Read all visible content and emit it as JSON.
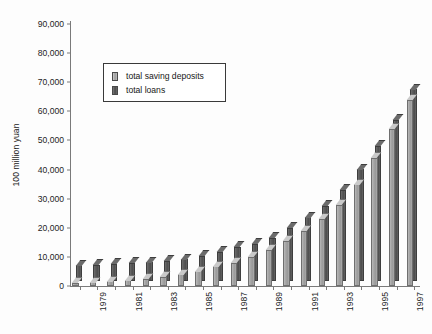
{
  "chart_data": {
    "type": "bar",
    "title": "",
    "subtitle": "",
    "xlabel": "",
    "ylabel": "100 million yuan",
    "ylim": [
      0,
      90000
    ],
    "ytick_labels": [
      "0",
      "10,000",
      "20,000",
      "30,000",
      "40,000",
      "50,000",
      "60,000",
      "70,000",
      "80,000",
      "90,000"
    ],
    "ytick_values": [
      0,
      10000,
      20000,
      30000,
      40000,
      50000,
      60000,
      70000,
      80000,
      90000
    ],
    "grid": false,
    "legend_position": "upper-left-inside",
    "style": "3d-grouped-bar",
    "categories": [
      1978,
      1979,
      1980,
      1981,
      1982,
      1983,
      1984,
      1985,
      1986,
      1987,
      1988,
      1989,
      1990,
      1991,
      1992,
      1993,
      1994,
      1995,
      1996,
      1997
    ],
    "xtick_labels": [
      "",
      "1979",
      "",
      "1981",
      "",
      "1983",
      "",
      "1985",
      "",
      "1987",
      "",
      "1989",
      "",
      "1991",
      "",
      "1993",
      "",
      "1995",
      "",
      "1997"
    ],
    "series": [
      {
        "name": "total saving deposits",
        "color": "#a8a8a8",
        "values": [
          1100,
          1300,
          1600,
          2000,
          2500,
          3200,
          4000,
          5000,
          6800,
          8000,
          10000,
          12500,
          15500,
          19000,
          23000,
          28000,
          35000,
          44000,
          54000,
          64000
        ]
      },
      {
        "name": "total loans",
        "color": "#585858",
        "values": [
          5000,
          5200,
          5500,
          5800,
          6000,
          6400,
          7000,
          8000,
          9500,
          11000,
          12000,
          14000,
          17500,
          21000,
          24500,
          29500,
          36000,
          43500,
          52000,
          64000
        ]
      }
    ],
    "series_back": {
      "name": "total loans",
      "values": [
        5600,
        5800,
        6100,
        6400,
        6600,
        7000,
        7600,
        8800,
        10200,
        11800,
        13000,
        15000,
        18500,
        22000,
        26000,
        31500,
        38500,
        46500,
        55500,
        66000
      ]
    }
  },
  "legend": {
    "items": [
      {
        "label": "total saving deposits",
        "swatch": "deposits-swatch"
      },
      {
        "label": "total loans",
        "swatch": "loans-swatch"
      }
    ]
  },
  "axes": {
    "y_axis_title": "100 million yuan"
  }
}
